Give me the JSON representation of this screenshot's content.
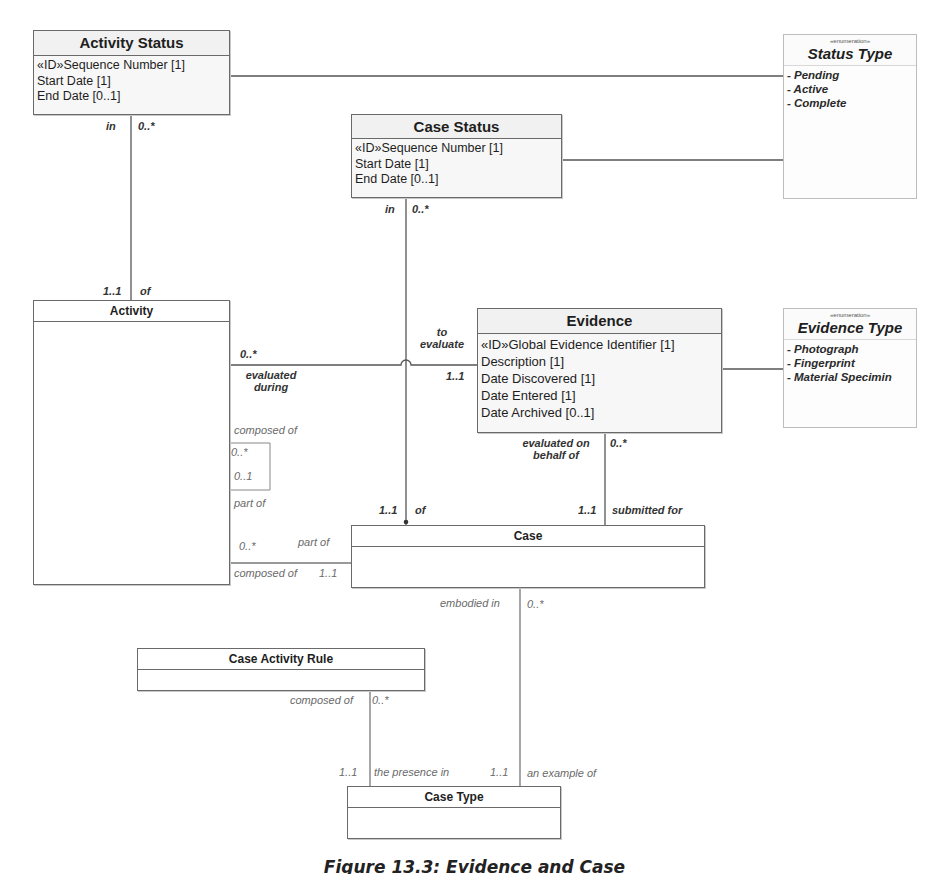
{
  "caption": "Figure 13.3: Evidence and Case",
  "classes": {
    "activity_status": {
      "name": "Activity Status",
      "attributes": [
        "«ID»Sequence Number [1]",
        "Start Date [1]",
        "End Date [0..1]"
      ]
    },
    "case_status": {
      "name": "Case Status",
      "attributes": [
        "«ID»Sequence Number [1]",
        "Start Date [1]",
        "End Date [0..1]"
      ]
    },
    "activity": {
      "name": "Activity"
    },
    "evidence": {
      "name": "Evidence",
      "attributes": [
        "«ID»Global Evidence Identifier [1]",
        "Description [1]",
        "Date Discovered [1]",
        "Date Entered [1]",
        "Date Archived [0..1]"
      ]
    },
    "case": {
      "name": "Case"
    },
    "case_activity_rule": {
      "name": "Case Activity Rule"
    },
    "case_type": {
      "name": "Case Type"
    }
  },
  "enumerations": {
    "status_type": {
      "stereotype": "«enumeration»",
      "name": "Status Type",
      "literals": [
        "- Pending",
        "- Active",
        "- Complete"
      ]
    },
    "evidence_type": {
      "stereotype": "«enumeration»",
      "name": "Evidence Type",
      "literals": [
        "- Photograph",
        "- Fingerprint",
        "- Material Specimin"
      ]
    }
  },
  "associations": {
    "activity_status_activity": {
      "role_top": "in",
      "mult_top": "0..*",
      "mult_bottom": "1..1",
      "role_bottom": "of"
    },
    "case_status_case": {
      "role_top": "in",
      "mult_top": "0..*",
      "mult_bottom": "1..1",
      "role_bottom": "of"
    },
    "activity_evidence": {
      "mult_activity": "0..*",
      "role_activity": "evaluated during",
      "role_evidence": "to evaluate",
      "mult_evidence": "1..1"
    },
    "evidence_case": {
      "role_top": "evaluated on behalf of",
      "mult_top": "0..*",
      "mult_bottom": "1..1",
      "role_bottom": "submitted for"
    },
    "activity_self": {
      "role_top": "composed of",
      "mult_1": "0..*",
      "mult_2": "0..1",
      "role_bottom": "part of"
    },
    "activity_case": {
      "mult_activity": "0..*",
      "role_case_top": "part of",
      "role_activity": "composed of",
      "mult_case": "1..1"
    },
    "case_casetype": {
      "role": "embodied in",
      "mult": "0..*",
      "mult_bottom": "1..1",
      "role_bottom": "an example of"
    },
    "rule_casetype": {
      "role": "composed of",
      "mult": "0..*",
      "mult_bottom": "1..1",
      "role_bottom": "the presence in"
    }
  },
  "colors": {
    "line": "#555555",
    "border": "#6a6a6a",
    "header_fill": "#f1f1f1"
  }
}
